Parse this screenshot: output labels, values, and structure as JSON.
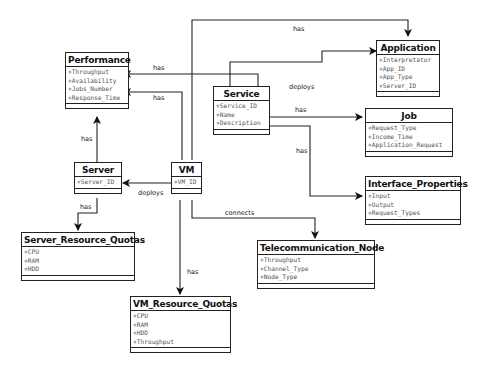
{
  "classes": {
    "performance": {
      "name": "Performance",
      "attributes": [
        "+Throughput",
        "+Availability",
        "+Jobs_Number",
        "+Response_Time"
      ]
    },
    "application": {
      "name": "Application",
      "attributes": [
        "+Interpretator",
        "+App_ID",
        "+App_Type",
        "+Server_ID"
      ]
    },
    "service": {
      "name": "Service",
      "attributes": [
        "+Service_ID",
        "+Name",
        "+Description"
      ]
    },
    "job": {
      "name": "Job",
      "attributes": [
        "+Request_Type",
        "+Income_Time",
        "+Application_Request"
      ]
    },
    "server": {
      "name": "Server",
      "attributes": [
        "+Server_ID"
      ]
    },
    "vm": {
      "name": "VM",
      "attributes": [
        "+VM_ID"
      ]
    },
    "interface_properties": {
      "name": "Interface_Properties",
      "attributes": [
        "+Input",
        "+Output",
        "+Request_Types"
      ]
    },
    "server_resource_quotas": {
      "name": "Server_Resource_Quotas",
      "attributes": [
        "+CPU",
        "+RAM",
        "+HDD"
      ]
    },
    "telecommunication_node": {
      "name": "Telecommunication_Node",
      "attributes": [
        "+Throughput",
        "+Channel_Type",
        "+Node_Type"
      ]
    },
    "vm_resource_quotas": {
      "name": "VM_Resource_Quotas",
      "attributes": [
        "+CPU",
        "+RAM",
        "+HDD",
        "+Throughput"
      ]
    }
  },
  "relations": [
    {
      "from": "VM",
      "to": "Application",
      "label": "has"
    },
    {
      "from": "Service",
      "to": "Performance",
      "label": "has"
    },
    {
      "from": "VM",
      "to": "Performance",
      "label": "has"
    },
    {
      "from": "Service",
      "to": "Application",
      "label": "deploys"
    },
    {
      "from": "Service",
      "to": "Job",
      "label": "has"
    },
    {
      "from": "Service",
      "to": "Interface_Properties",
      "label": "has"
    },
    {
      "from": "Server",
      "to": "Performance",
      "label": "has"
    },
    {
      "from": "VM",
      "to": "Server",
      "label": "deploys"
    },
    {
      "from": "Server",
      "to": "Server_Resource_Quotas",
      "label": "has"
    },
    {
      "from": "VM",
      "to": "Telecommunication_Node",
      "label": "connects"
    },
    {
      "from": "VM",
      "to": "VM_Resource_Quotas",
      "label": "has"
    }
  ],
  "colors": {
    "line": "#222222",
    "attribute_text": "#555555"
  }
}
